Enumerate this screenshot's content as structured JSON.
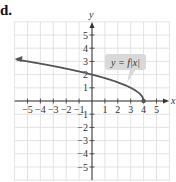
{
  "part_label": "d.",
  "chart_data": {
    "type": "line",
    "title": "",
    "xlabel": "x",
    "ylabel": "y",
    "xlim": [
      -6,
      6
    ],
    "ylim": [
      -6,
      6
    ],
    "grid": true,
    "x_ticks": [
      -5,
      -4,
      -3,
      -2,
      -1,
      1,
      2,
      3,
      4,
      5
    ],
    "y_ticks": [
      -5,
      -4,
      -3,
      -2,
      -1,
      1,
      2,
      3,
      4,
      5
    ],
    "x_tick_labels": [
      "−5",
      "−4",
      "−3",
      "−2",
      "−1",
      "1",
      "2",
      "3",
      "4",
      "5"
    ],
    "y_tick_labels": [
      "−5",
      "−4",
      "−3",
      "−2",
      "−1",
      "1",
      "2",
      "3",
      "4",
      "5"
    ],
    "series": [
      {
        "name": "y = f(x)",
        "function": "sqrt(4 - x)",
        "x": [
          -5.85,
          -5,
          -4,
          -3,
          -2,
          -1,
          0,
          1,
          2,
          3,
          3.5,
          3.8,
          4
        ],
        "y": [
          3.14,
          3.0,
          2.83,
          2.65,
          2.45,
          2.24,
          2.0,
          1.73,
          1.41,
          1.0,
          0.71,
          0.45,
          0.0
        ],
        "left_arrow": true,
        "endpoint_closed": [
          4,
          0
        ],
        "color": "#555555"
      }
    ],
    "annotation": {
      "text": "y = f(x)",
      "display": "y = f|x|",
      "anchor": [
        2.8,
        1.2
      ]
    }
  },
  "colors": {
    "grid": "#dcdcdc",
    "axis": "#333333",
    "curve": "#555555",
    "label_box": "#d9d9d9"
  }
}
